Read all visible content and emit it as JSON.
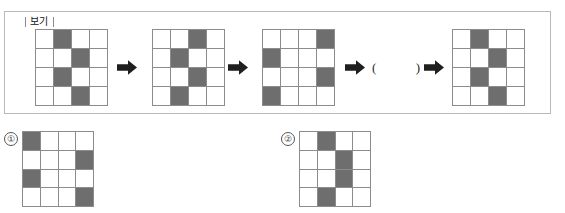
{
  "example_box": {
    "label": "보기",
    "blank": {
      "open": "(",
      "close": ")"
    },
    "arrow_icon": "right-arrow-icon",
    "sequence": [
      {
        "name": "step-1",
        "rows": 4,
        "cols": 4,
        "filled": [
          [
            0,
            1
          ],
          [
            1,
            2
          ],
          [
            2,
            1
          ],
          [
            3,
            2
          ]
        ]
      },
      {
        "name": "step-2",
        "rows": 4,
        "cols": 4,
        "filled": [
          [
            0,
            2
          ],
          [
            1,
            1
          ],
          [
            2,
            2
          ],
          [
            3,
            1
          ]
        ]
      },
      {
        "name": "step-3",
        "rows": 4,
        "cols": 4,
        "filled": [
          [
            0,
            3
          ],
          [
            1,
            0
          ],
          [
            2,
            3
          ],
          [
            3,
            0
          ]
        ]
      },
      {
        "name": "step-5",
        "rows": 4,
        "cols": 4,
        "filled": [
          [
            0,
            1
          ],
          [
            1,
            2
          ],
          [
            2,
            1
          ],
          [
            3,
            2
          ]
        ]
      }
    ]
  },
  "options": [
    {
      "marker": "①",
      "name": "option-1",
      "rows": 4,
      "cols": 4,
      "filled": [
        [
          0,
          0
        ],
        [
          1,
          3
        ],
        [
          2,
          0
        ],
        [
          3,
          3
        ]
      ]
    },
    {
      "marker": "②",
      "name": "option-2",
      "rows": 4,
      "cols": 4,
      "filled": [
        [
          0,
          1
        ],
        [
          1,
          2
        ],
        [
          2,
          2
        ],
        [
          3,
          1
        ]
      ]
    }
  ],
  "colors": {
    "cell_filled": "#6e6e6e",
    "cell_empty": "#ffffff",
    "grid_line": "#8c8c8c",
    "box_border": "#b9b9b9",
    "arrow": "#1f1f1f"
  }
}
